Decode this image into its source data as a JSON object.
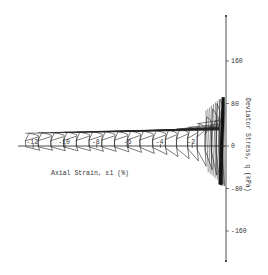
{
  "chart_data": {
    "type": "line",
    "title": "",
    "xlabel": "Axial Strain, ε1 (%)",
    "ylabel": "Deviator Stress, q (kPa)",
    "xlim": [
      -13,
      0
    ],
    "ylim": [
      -200,
      200
    ],
    "x_ticks": [
      -12,
      -10,
      -8,
      -6,
      -4,
      -2
    ],
    "x_tick_labels": [
      "-12",
      "-10",
      "-8",
      "-6",
      "-4",
      "-2"
    ],
    "y_ticks": [
      160,
      80,
      0,
      -80,
      -160
    ],
    "y_tick_labels": [
      "160",
      "80",
      "0",
      "-80",
      "-160"
    ],
    "grid": false,
    "legend": null,
    "series": [
      {
        "name": "cyclic response",
        "cycles": [
          {
            "strain_min": -0.1,
            "q_max": 92,
            "q_min": -75
          },
          {
            "strain_min": -0.3,
            "q_max": 88,
            "q_min": -72
          },
          {
            "strain_min": -0.5,
            "q_max": 80,
            "q_min": -65
          },
          {
            "strain_min": -0.8,
            "q_max": 70,
            "q_min": -55
          },
          {
            "strain_min": -1.2,
            "q_max": 55,
            "q_min": -45
          },
          {
            "strain_min": -1.7,
            "q_max": 42,
            "q_min": -38
          },
          {
            "strain_min": -2.3,
            "q_max": 35,
            "q_min": -28
          },
          {
            "strain_min": -3.0,
            "q_max": 32,
            "q_min": -24
          },
          {
            "strain_min": -3.7,
            "q_max": 30,
            "q_min": -20
          },
          {
            "strain_min": -4.5,
            "q_max": 29,
            "q_min": -16
          },
          {
            "strain_min": -5.3,
            "q_max": 28,
            "q_min": -14
          },
          {
            "strain_min": -6.1,
            "q_max": 28,
            "q_min": -12
          },
          {
            "strain_min": -6.9,
            "q_max": 27,
            "q_min": -11
          },
          {
            "strain_min": -7.7,
            "q_max": 27,
            "q_min": -10
          },
          {
            "strain_min": -8.5,
            "q_max": 27,
            "q_min": -10
          },
          {
            "strain_min": -9.3,
            "q_max": 26,
            "q_min": -9
          },
          {
            "strain_min": -10.1,
            "q_max": 26,
            "q_min": -9
          },
          {
            "strain_min": -10.9,
            "q_max": 25,
            "q_min": -9
          },
          {
            "strain_min": -11.7,
            "q_max": 25,
            "q_min": -8
          },
          {
            "strain_min": -12.5,
            "q_max": 24,
            "q_min": -8
          }
        ]
      }
    ]
  }
}
